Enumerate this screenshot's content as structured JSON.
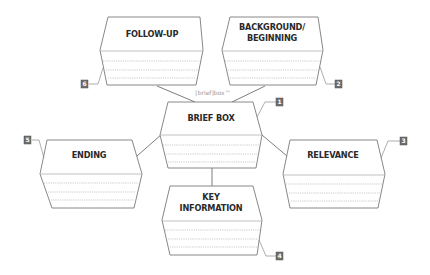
{
  "diagram": {
    "watermark": "[brief]box™",
    "colors": {
      "stroke": "#7a7a7a",
      "rule": "#a8a8a8",
      "label": "#2a2a2a",
      "badge": "#6d6d6d"
    },
    "boxes": [
      {
        "id": "brief-box",
        "label_lines": [
          "BRIEF BOX"
        ],
        "badge": "1",
        "role": "center"
      },
      {
        "id": "background",
        "label_lines": [
          "BACKGROUND/",
          "BEGINNING"
        ],
        "badge": "2",
        "role": "top-right"
      },
      {
        "id": "relevance",
        "label_lines": [
          "RELEVANCE"
        ],
        "badge": "3",
        "role": "right"
      },
      {
        "id": "key-information",
        "label_lines": [
          "KEY",
          "INFORMATION"
        ],
        "badge": "4",
        "role": "bottom"
      },
      {
        "id": "ending",
        "label_lines": [
          "ENDING"
        ],
        "badge": "5",
        "role": "left"
      },
      {
        "id": "follow-up",
        "label_lines": [
          "FOLLOW-UP"
        ],
        "badge": "6",
        "role": "top-left"
      }
    ],
    "connections": [
      [
        "follow-up",
        "brief-box"
      ],
      [
        "background",
        "brief-box"
      ],
      [
        "ending",
        "brief-box"
      ],
      [
        "relevance",
        "brief-box"
      ],
      [
        "brief-box",
        "key-information"
      ]
    ]
  }
}
